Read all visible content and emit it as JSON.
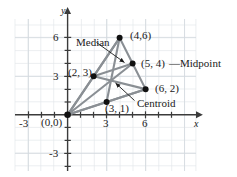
{
  "figure": {
    "axis_labels": {
      "x": "x",
      "y": "y"
    },
    "colors": {
      "grid_minor": "#e2e6ea",
      "grid_major": "#cfd6dc",
      "axis": "#3b3b3b",
      "segment": "#8a8f94",
      "point": "#111111",
      "text": "#1a1a1a",
      "background": "#ffffff"
    },
    "x_ticks": [
      {
        "value": -3,
        "label": "-3"
      },
      {
        "value": 3,
        "label": "3"
      },
      {
        "value": 6,
        "label": "6"
      }
    ],
    "y_ticks": [
      {
        "value": 6,
        "label": "6"
      },
      {
        "value": 3,
        "label": "3"
      },
      {
        "value": -3,
        "label": "-3"
      }
    ],
    "points": [
      {
        "name": "origin",
        "x": 0,
        "y": 0,
        "label": "(0,0)"
      },
      {
        "name": "vertex-b",
        "x": 2,
        "y": 3,
        "label": "(2, 3)"
      },
      {
        "name": "vertex-c",
        "x": 4,
        "y": 6,
        "label": "(4,6)"
      },
      {
        "name": "midpoint",
        "x": 5,
        "y": 4,
        "label": "(5, 4)"
      },
      {
        "name": "vertex-d",
        "x": 6,
        "y": 2,
        "label": "(6, 2)"
      },
      {
        "name": "foot",
        "x": 3,
        "y": 1,
        "label": "(3, 1)"
      }
    ],
    "segments": [
      {
        "from": [
          0,
          0
        ],
        "to": [
          2,
          3
        ]
      },
      {
        "from": [
          0,
          0
        ],
        "to": [
          4,
          6
        ]
      },
      {
        "from": [
          0,
          0
        ],
        "to": [
          5,
          4
        ]
      },
      {
        "from": [
          0,
          0
        ],
        "to": [
          6,
          2
        ]
      },
      {
        "from": [
          0,
          0
        ],
        "to": [
          3,
          1
        ]
      },
      {
        "from": [
          2,
          3
        ],
        "to": [
          4,
          6
        ]
      },
      {
        "from": [
          2,
          3
        ],
        "to": [
          6,
          2
        ]
      },
      {
        "from": [
          4,
          6
        ],
        "to": [
          5,
          4
        ]
      },
      {
        "from": [
          5,
          4
        ],
        "to": [
          6,
          2
        ]
      },
      {
        "from": [
          4,
          6
        ],
        "to": [
          3,
          1
        ]
      },
      {
        "from": [
          3,
          1
        ],
        "to": [
          6,
          2
        ]
      },
      {
        "from": [
          2,
          3
        ],
        "to": [
          5,
          4
        ]
      }
    ],
    "annotations": {
      "median": "Median",
      "midpoint_dash": "—",
      "midpoint": "Midpoint",
      "centroid": "Centroid"
    },
    "centroid_point": {
      "x": 3.4,
      "y": 2.73
    },
    "axis_ranges": {
      "x": [
        -4.2,
        9.5
      ],
      "y": [
        -5.8,
        7.8
      ]
    },
    "grid": "on"
  }
}
